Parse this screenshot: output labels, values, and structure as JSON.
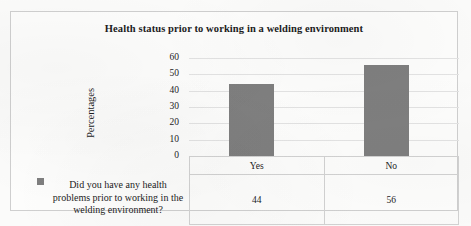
{
  "chart_data": {
    "type": "bar",
    "title": "Health status prior to working in a welding environment",
    "xlabel": "",
    "ylabel": "Percentages",
    "categories": [
      "Yes",
      "No"
    ],
    "values": [
      44,
      56
    ],
    "series": [
      {
        "name": "Did you have any health problems prior to working in the welding environment?",
        "values": [
          44,
          56
        ]
      }
    ],
    "ylim": [
      0,
      60
    ],
    "yticks": [
      0,
      10,
      20,
      30,
      40,
      50,
      60
    ],
    "ytick_labels": [
      "0",
      "10",
      "20",
      "30",
      "40",
      "50",
      "60"
    ],
    "grid": true,
    "legend_position": "bottom-left-table",
    "bar_color": "#7f7f7f",
    "data_table_visible": true
  },
  "legend": {
    "marker_name": "legend-square-marker",
    "label": "Did you have any health problems prior to working in the welding environment?"
  },
  "table": {
    "category_row": [
      "Yes",
      "No"
    ],
    "value_row": [
      "44",
      "56"
    ]
  },
  "colors": {
    "bar": "#7f7f7f",
    "frame_border": "#cfcfcf",
    "gridline": "#e3e3e3",
    "page_background": "#fbfbfa",
    "text": "#1c1c1c"
  }
}
